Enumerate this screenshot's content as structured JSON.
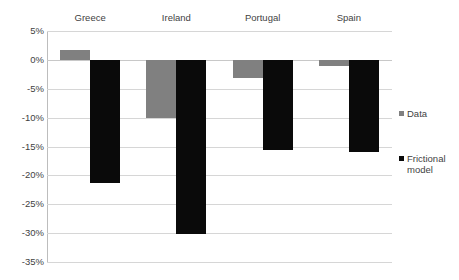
{
  "chart_data": {
    "type": "bar",
    "title": "",
    "subtitle": "",
    "xlabel": "",
    "ylabel": "",
    "categories": [
      "Greece",
      "Ireland",
      "Portugal",
      "Spain"
    ],
    "series": [
      {
        "name": "Data",
        "color": "#808080",
        "values": [
          1.7,
          -10.0,
          -3.1,
          -1.0
        ]
      },
      {
        "name": "Frictional model",
        "color": "#0a0a0a",
        "values": [
          -21.3,
          -30.2,
          -15.6,
          -15.9
        ]
      }
    ],
    "ylim": [
      -35,
      5
    ],
    "ytick_values": [
      5,
      0,
      -5,
      -10,
      -15,
      -20,
      -25,
      -30,
      -35
    ],
    "ytick_labels": [
      "5%",
      "0%",
      "-5%",
      "-10%",
      "-15%",
      "-20%",
      "-25%",
      "-30%",
      "-35%"
    ],
    "grid": true,
    "grid_axis": "y",
    "legend_position": "right",
    "category_labels_position": "top",
    "value_format": "percent"
  },
  "legend": {
    "entries": [
      {
        "label": "Data",
        "swatch": "gray-square-icon"
      },
      {
        "label": "Frictional model",
        "swatch": "black-square-icon"
      }
    ]
  }
}
